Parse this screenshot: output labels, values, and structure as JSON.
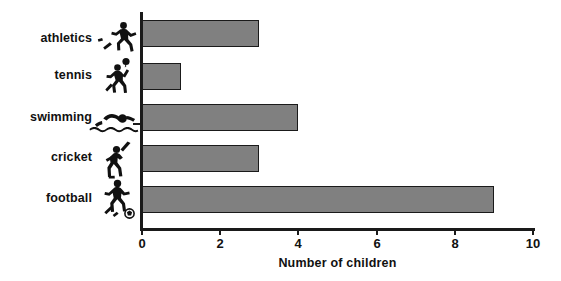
{
  "chart_data": {
    "type": "bar",
    "orientation": "horizontal",
    "title": "",
    "xlabel": "Number of children",
    "ylabel": "",
    "categories": [
      "athletics",
      "tennis",
      "swimming",
      "cricket",
      "football"
    ],
    "values": [
      3,
      1,
      4,
      3,
      9
    ],
    "xlim": [
      0,
      10
    ],
    "xticks": [
      0,
      2,
      4,
      6,
      8,
      10
    ],
    "xtick_labels": [
      "0",
      "2",
      "4",
      "6",
      "8",
      "10"
    ],
    "grid": false,
    "legend": null,
    "bar_color": "#808080",
    "bar_edge_color": "#1a1a1a",
    "axis_color": "#1a1a1a",
    "background": "#ffffff",
    "category_icons": [
      "running-athlete-icon",
      "tennis-player-icon",
      "swimmer-icon",
      "cricket-batsman-icon",
      "footballer-icon"
    ]
  }
}
